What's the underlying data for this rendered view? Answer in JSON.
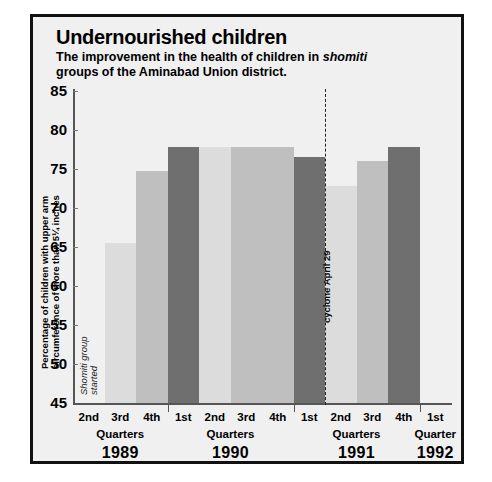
{
  "figure": {
    "title": "Undernourished children",
    "subtitle_part1": "The improvement in the health of children in ",
    "subtitle_italic": "shomiti",
    "subtitle_part2": "groups of the Aminabad Union district."
  },
  "annotations": {
    "start_line1": "Shomiti group",
    "start_line2": "started",
    "event": "cyclone April 29"
  },
  "colors": {
    "bar_light": "#dcdcdc",
    "bar_medium": "#bfbfbf",
    "bar_dark": "#6f6f6f",
    "background": "#f0f0f0",
    "frame": "#111111",
    "axis": "#555555"
  },
  "chart_data": {
    "type": "bar",
    "title": "Undernourished children",
    "subtitle": "The improvement in the health of children in shomiti groups of the Aminabad Union district.",
    "xlabel": "",
    "ylabel": "Percentage of children with upper arm circumference of more than 5¼ inches",
    "ylim": [
      45,
      85
    ],
    "yticks": [
      45,
      50,
      55,
      60,
      65,
      70,
      75,
      80,
      85
    ],
    "grid": false,
    "legend": "none",
    "categories": [
      "2nd",
      "3rd",
      "4th",
      "1st",
      "2nd",
      "3rd",
      "4th",
      "1st",
      "2nd",
      "3rd",
      "4th",
      "1st"
    ],
    "values": [
      null,
      65.5,
      74.8,
      77.8,
      77.8,
      77.8,
      77.8,
      76.5,
      72.8,
      76.0,
      77.8,
      null
    ],
    "bars": [
      {
        "quarter": "2nd",
        "year": "1989",
        "value": null,
        "shade": "none"
      },
      {
        "quarter": "3rd",
        "year": "1989",
        "value": 65.5,
        "shade": "light"
      },
      {
        "quarter": "4th",
        "year": "1989",
        "value": 74.8,
        "shade": "medium"
      },
      {
        "quarter": "1st",
        "year": "1990",
        "value": 77.8,
        "shade": "dark"
      },
      {
        "quarter": "2nd",
        "year": "1990",
        "value": 77.8,
        "shade": "light"
      },
      {
        "quarter": "3rd",
        "year": "1990",
        "value": 77.8,
        "shade": "medium"
      },
      {
        "quarter": "4th",
        "year": "1990",
        "value": 77.8,
        "shade": "medium"
      },
      {
        "quarter": "1st",
        "year": "1991",
        "value": 76.5,
        "shade": "dark"
      },
      {
        "quarter": "2nd",
        "year": "1991",
        "value": 72.8,
        "shade": "light"
      },
      {
        "quarter": "3rd",
        "year": "1991",
        "value": 76.0,
        "shade": "medium"
      },
      {
        "quarter": "4th",
        "year": "1991",
        "value": 77.8,
        "shade": "dark"
      },
      {
        "quarter": "1st",
        "year": "1992",
        "value": null,
        "shade": "none"
      }
    ],
    "groups": [
      {
        "year": "1989",
        "quarters_label": "Quarters",
        "quarters": [
          "2nd",
          "3rd",
          "4th"
        ]
      },
      {
        "year": "1990",
        "quarters_label": "Quarters",
        "quarters": [
          "1st",
          "2nd",
          "3rd",
          "4th"
        ]
      },
      {
        "year": "1991",
        "quarters_label": "Quarters",
        "quarters": [
          "1st",
          "2nd",
          "3rd",
          "4th"
        ]
      },
      {
        "year": "1992",
        "quarters_label": "Quarter",
        "quarters": [
          "1st"
        ]
      }
    ],
    "annotations": [
      {
        "text": "Shomiti group started",
        "at": "1989 2nd quarter",
        "orientation": "vertical"
      },
      {
        "text": "cyclone April 29",
        "at": "between 1991 1st and 2nd quarter",
        "orientation": "vertical",
        "line": "dashed"
      }
    ]
  }
}
